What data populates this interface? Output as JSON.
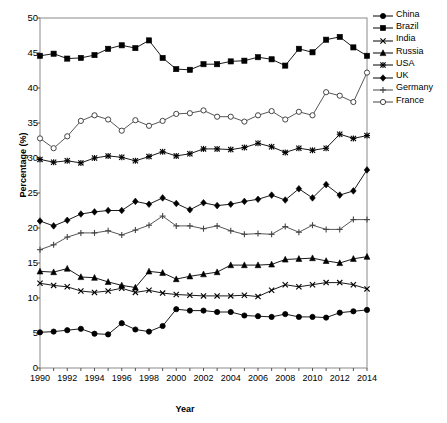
{
  "chart_data": {
    "type": "line",
    "title": "",
    "xlabel": "Year",
    "ylabel": "Percentage (%)",
    "xlim": [
      1990,
      2014
    ],
    "ylim": [
      0,
      50
    ],
    "ytick_step": 5,
    "xtick_step": 2,
    "grid": false,
    "legend_position": "right",
    "x": [
      1990,
      1991,
      1992,
      1993,
      1994,
      1995,
      1996,
      1997,
      1998,
      1999,
      2000,
      2001,
      2002,
      2003,
      2004,
      2005,
      2006,
      2007,
      2008,
      2009,
      2010,
      2011,
      2012,
      2013,
      2014
    ],
    "yticks": [
      0,
      5,
      10,
      15,
      20,
      25,
      30,
      35,
      40,
      45,
      50
    ],
    "xticks": [
      1990,
      1992,
      1994,
      1996,
      1998,
      2000,
      2002,
      2004,
      2006,
      2008,
      2010,
      2012,
      2014
    ],
    "series": [
      {
        "name": "China",
        "marker": "filled-circle",
        "color": "#000000",
        "values": [
          5.1,
          5.2,
          5.4,
          5.6,
          4.9,
          4.8,
          6.4,
          5.5,
          5.2,
          6.0,
          8.4,
          8.2,
          8.2,
          8.0,
          8.0,
          7.5,
          7.4,
          7.3,
          7.7,
          7.3,
          7.3,
          7.2,
          7.9,
          8.1,
          8.3
        ]
      },
      {
        "name": "Brazil",
        "marker": "filled-square",
        "color": "#000000",
        "values": [
          44.6,
          44.9,
          44.2,
          44.3,
          44.7,
          45.6,
          46.1,
          45.7,
          46.8,
          44.3,
          42.7,
          42.6,
          43.4,
          43.4,
          43.8,
          43.9,
          44.4,
          44.1,
          43.2,
          45.6,
          45.1,
          46.9,
          47.3,
          45.8,
          44.6
        ]
      },
      {
        "name": "India",
        "marker": "cross",
        "color": "#000000",
        "values": [
          12.1,
          11.8,
          11.6,
          11.0,
          10.8,
          11.0,
          11.4,
          10.8,
          11.1,
          10.7,
          10.5,
          10.4,
          10.3,
          10.3,
          10.3,
          10.4,
          10.2,
          11.1,
          11.9,
          11.6,
          11.9,
          12.2,
          12.2,
          11.9,
          11.3
        ]
      },
      {
        "name": "Russia",
        "marker": "filled-triangle",
        "color": "#000000",
        "values": [
          13.8,
          13.7,
          14.2,
          13.0,
          12.9,
          12.3,
          11.8,
          11.5,
          13.8,
          13.6,
          12.7,
          13.1,
          13.4,
          13.7,
          14.7,
          14.7,
          14.7,
          14.8,
          15.5,
          15.6,
          15.7,
          15.3,
          15.0,
          15.6,
          15.9
        ]
      },
      {
        "name": "USA",
        "marker": "asterisk",
        "color": "#000000",
        "values": [
          29.8,
          29.4,
          29.6,
          29.3,
          30.0,
          30.3,
          30.1,
          29.6,
          30.2,
          30.9,
          30.3,
          30.6,
          31.3,
          31.3,
          31.2,
          31.5,
          32.1,
          31.6,
          30.8,
          31.4,
          31.1,
          31.4,
          33.4,
          32.8,
          33.2
        ]
      },
      {
        "name": "UK",
        "marker": "filled-diamond",
        "color": "#000000",
        "values": [
          21.0,
          20.3,
          21.1,
          22.0,
          22.3,
          22.5,
          22.5,
          23.8,
          23.4,
          24.3,
          23.5,
          22.6,
          23.6,
          23.2,
          23.4,
          23.8,
          24.1,
          24.7,
          24.0,
          25.6,
          24.3,
          26.2,
          24.7,
          25.3,
          28.3
        ]
      },
      {
        "name": "Germany",
        "marker": "plus",
        "color": "#444444",
        "values": [
          16.9,
          17.6,
          18.7,
          19.3,
          19.3,
          19.6,
          19.0,
          19.7,
          20.4,
          21.7,
          20.3,
          20.3,
          19.9,
          20.3,
          19.6,
          19.1,
          19.2,
          19.1,
          20.2,
          19.4,
          20.4,
          19.8,
          19.8,
          21.2,
          21.2
        ]
      },
      {
        "name": "France",
        "marker": "open-circle",
        "color": "#444444",
        "values": [
          32.8,
          31.4,
          33.1,
          35.3,
          36.1,
          35.5,
          33.9,
          35.4,
          34.6,
          35.3,
          36.3,
          36.4,
          36.8,
          35.9,
          35.9,
          35.2,
          36.1,
          36.7,
          35.5,
          36.6,
          36.1,
          39.4,
          38.9,
          38.0,
          42.2
        ]
      }
    ]
  },
  "legend": {
    "items": [
      "China",
      "Brazil",
      "India",
      "Russia",
      "USA",
      "UK",
      "Germany",
      "France"
    ]
  },
  "axes": {
    "y_title": "Percentage (%)",
    "x_title": "Year"
  }
}
